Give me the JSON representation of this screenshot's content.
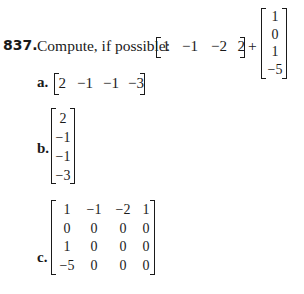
{
  "problem": {
    "number": "837.",
    "prompt": "Compute, if possible:",
    "row_vector": [
      "1",
      "−1",
      "−2",
      "2"
    ],
    "operator": "+",
    "column_vector": [
      "1",
      "0",
      "1",
      "−5"
    ]
  },
  "options": [
    {
      "label": "a.",
      "type": "row",
      "values": [
        "2",
        "−1",
        "−1",
        "−3"
      ]
    },
    {
      "label": "b.",
      "type": "column",
      "values": [
        "2",
        "−1",
        "−1",
        "−3"
      ]
    },
    {
      "label": "c.",
      "type": "matrix",
      "values": [
        [
          "1",
          "−1",
          "−2",
          "1"
        ],
        [
          "0",
          "0",
          "0",
          "0"
        ],
        [
          "1",
          "0",
          "0",
          "0"
        ],
        [
          "−5",
          "0",
          "0",
          "0"
        ]
      ]
    }
  ]
}
